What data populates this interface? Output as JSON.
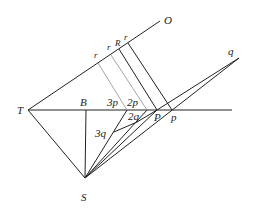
{
  "diagram": {
    "labels": {
      "O": "O",
      "T": "T",
      "B": "B",
      "S": "S",
      "q": "q",
      "R": "R",
      "r1": "r",
      "r2": "r",
      "r3": "r",
      "p3": "3p",
      "p2": "2p",
      "q2": "2q",
      "q3": "3q",
      "P": "P",
      "p": "p"
    }
  }
}
